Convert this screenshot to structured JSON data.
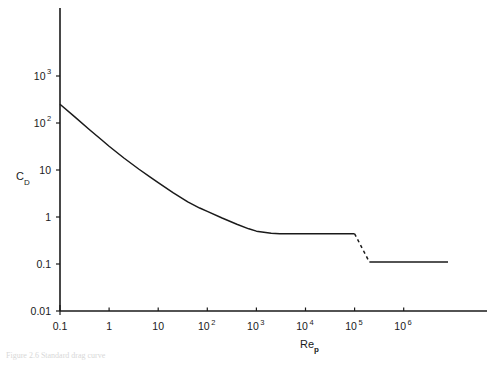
{
  "figure": {
    "caption": "Figure 2.6 Standard drag curve"
  },
  "chart_data": {
    "type": "line",
    "title": "",
    "subtitle": "",
    "xlabel": "Re",
    "xlabel_sub": "p",
    "ylabel": "C",
    "ylabel_sub": "D",
    "xscale": "log",
    "yscale": "log",
    "xlim": [
      0.1,
      8000000
    ],
    "ylim": [
      0.01,
      3000
    ],
    "grid": false,
    "legend": null,
    "xticks": [
      {
        "value": 0.1,
        "mantissa": "0.1",
        "exponent": ""
      },
      {
        "value": 1,
        "mantissa": "1",
        "exponent": ""
      },
      {
        "value": 10,
        "mantissa": "10",
        "exponent": ""
      },
      {
        "value": 100,
        "mantissa": "10",
        "exponent": "2"
      },
      {
        "value": 1000,
        "mantissa": "10",
        "exponent": "3"
      },
      {
        "value": 10000,
        "mantissa": "10",
        "exponent": "4"
      },
      {
        "value": 100000,
        "mantissa": "10",
        "exponent": "5"
      },
      {
        "value": 1000000,
        "mantissa": "10",
        "exponent": "6"
      }
    ],
    "yticks": [
      {
        "value": 1000,
        "mantissa": "10",
        "exponent": "3"
      },
      {
        "value": 100,
        "mantissa": "10",
        "exponent": "2"
      },
      {
        "value": 10,
        "mantissa": "10",
        "exponent": ""
      },
      {
        "value": 1,
        "mantissa": "1",
        "exponent": ""
      },
      {
        "value": 0.1,
        "mantissa": "0.1",
        "exponent": ""
      },
      {
        "value": 0.01,
        "mantissa": "0.01",
        "exponent": ""
      }
    ],
    "series": [
      {
        "name": "standard drag curve",
        "style": "solid",
        "color": "#1a1a1a",
        "points": [
          {
            "x": 0.1,
            "y": 250
          },
          {
            "x": 0.2,
            "y": 135
          },
          {
            "x": 0.4,
            "y": 72
          },
          {
            "x": 0.7,
            "y": 44
          },
          {
            "x": 1.0,
            "y": 32
          },
          {
            "x": 2.0,
            "y": 18
          },
          {
            "x": 4.0,
            "y": 10.5
          },
          {
            "x": 7.0,
            "y": 7.0
          },
          {
            "x": 10,
            "y": 5.4
          },
          {
            "x": 20,
            "y": 3.3
          },
          {
            "x": 40,
            "y": 2.1
          },
          {
            "x": 70,
            "y": 1.55
          },
          {
            "x": 100,
            "y": 1.32
          },
          {
            "x": 200,
            "y": 0.95
          },
          {
            "x": 400,
            "y": 0.7
          },
          {
            "x": 700,
            "y": 0.56
          },
          {
            "x": 1000,
            "y": 0.5
          },
          {
            "x": 2000,
            "y": 0.45
          },
          {
            "x": 3000,
            "y": 0.44
          },
          {
            "x": 10000,
            "y": 0.44
          },
          {
            "x": 100000,
            "y": 0.44
          }
        ]
      },
      {
        "name": "drag crisis transition",
        "style": "dashed",
        "color": "#1a1a1a",
        "points": [
          {
            "x": 100000,
            "y": 0.44
          },
          {
            "x": 200000,
            "y": 0.11
          }
        ]
      },
      {
        "name": "supercritical plateau",
        "style": "solid",
        "color": "#1a1a1a",
        "points": [
          {
            "x": 200000,
            "y": 0.11
          },
          {
            "x": 8000000,
            "y": 0.11
          }
        ]
      }
    ]
  }
}
